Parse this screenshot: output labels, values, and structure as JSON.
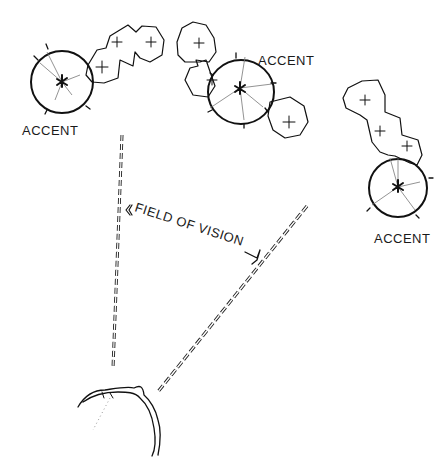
{
  "diagram": {
    "type": "hand-drawn landscape sketch",
    "labels": {
      "accent_1": "ACCENT",
      "accent_2": "ACCENT",
      "accent_3": "ACCENT",
      "field_of_vision": "FIELD OF VISION"
    },
    "groups": [
      {
        "name": "left-group",
        "accent_label": "ACCENT",
        "shrub_count": 3
      },
      {
        "name": "center-group",
        "accent_label": "ACCENT",
        "shrub_count": 3
      },
      {
        "name": "right-group",
        "accent_label": "ACCENT",
        "shrub_count": 3
      }
    ],
    "viewer": "head (top view) at bottom",
    "colors": {
      "ink": "#111111",
      "background": "#ffffff"
    }
  }
}
